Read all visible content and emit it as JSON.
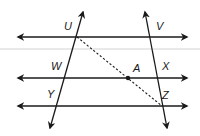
{
  "diagram": {
    "type": "geometry-parallel-lines-transversals",
    "horizontal_lines": [
      {
        "id": "top",
        "y": 37
      },
      {
        "id": "middle",
        "y": 78
      },
      {
        "id": "bottom",
        "y": 106
      }
    ],
    "transversals": [
      {
        "id": "left",
        "through": [
          "U",
          "W",
          "Y"
        ]
      },
      {
        "id": "right",
        "through": [
          "V",
          "X",
          "Z"
        ]
      }
    ],
    "dashed_segment": {
      "from": "U",
      "to": "Z",
      "through": "A"
    },
    "labels": {
      "U": "U",
      "V": "V",
      "W": "W",
      "A": "A",
      "X": "X",
      "Y": "Y",
      "Z": "Z"
    },
    "colors": {
      "ink": "#1a1a1a",
      "background": "#ffffff",
      "scan_band": "#e6e6e6"
    }
  }
}
